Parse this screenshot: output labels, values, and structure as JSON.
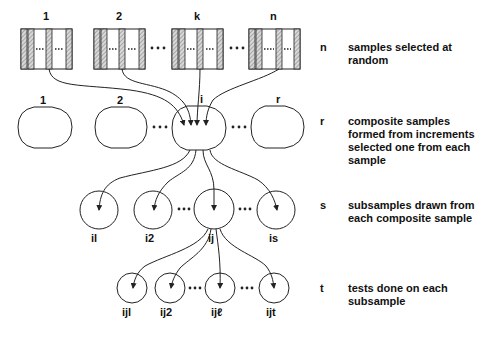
{
  "levels": {
    "samples": {
      "labels": [
        "1",
        "2",
        "k",
        "n"
      ],
      "key": "n",
      "description": "samples selected at random"
    },
    "composites": {
      "labels": [
        "1",
        "2",
        "i",
        "r"
      ],
      "key": "r",
      "description": "composite samples formed from increments selected one from each sample"
    },
    "subsamples": {
      "labels": [
        "il",
        "i2",
        "ij",
        "is"
      ],
      "key": "s",
      "description": "subsamples drawn from each composite sample"
    },
    "tests": {
      "labels": [
        "ijl",
        "ij2",
        "ijℓ",
        "ijt"
      ],
      "key": "t",
      "description": "tests done on each subsample"
    }
  },
  "ellipsis": "• • •"
}
